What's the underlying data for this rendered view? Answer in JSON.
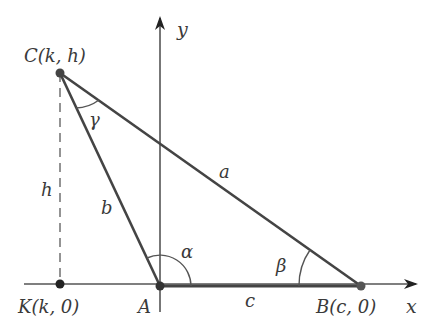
{
  "diagram": {
    "type": "triangle-coordinate-geometry",
    "axes": {
      "x_label": "x",
      "y_label": "y"
    },
    "points": {
      "C": {
        "name": "C",
        "coords": "(k, h)",
        "label": "C(k, h)"
      },
      "K": {
        "name": "K",
        "coords": "(k, 0)",
        "label": "K(k, 0)"
      },
      "A": {
        "name": "A",
        "label": "A"
      },
      "B": {
        "name": "B",
        "coords": "(c, 0)",
        "label": "B(c, 0)"
      }
    },
    "sides": {
      "a": "a",
      "b": "b",
      "c": "c",
      "h": "h"
    },
    "angles": {
      "alpha": "α",
      "beta": "β",
      "gamma": "γ"
    },
    "colors": {
      "line": "#444444",
      "axis": "#555555",
      "point": "#444444",
      "text": "#3a3a3a"
    }
  }
}
